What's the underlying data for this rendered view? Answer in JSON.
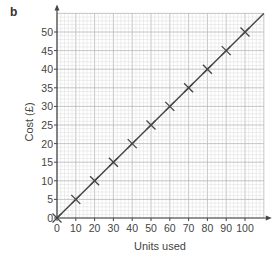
{
  "part_label": "b",
  "chart_data": {
    "type": "line",
    "title": "",
    "xlabel": "Units used",
    "ylabel": "Cost (£)",
    "xlim": [
      0,
      110
    ],
    "ylim": [
      0,
      55
    ],
    "x_ticks": [
      0,
      10,
      20,
      30,
      40,
      50,
      60,
      70,
      80,
      90,
      100
    ],
    "y_ticks": [
      0,
      5,
      10,
      15,
      20,
      25,
      30,
      35,
      40,
      45,
      50
    ],
    "grid": true,
    "legend": null,
    "series": [
      {
        "name": "Cost",
        "style": "line-with-cross-markers",
        "color": "#444444",
        "x": [
          0,
          10,
          20,
          30,
          40,
          50,
          60,
          70,
          80,
          90,
          100
        ],
        "y": [
          0,
          5,
          10,
          15,
          20,
          25,
          30,
          35,
          40,
          45,
          50
        ]
      }
    ],
    "line_extends_to": {
      "x": 110,
      "y": 55
    }
  },
  "colors": {
    "grid_minor": "#dddddd",
    "grid_major": "#b8b8b8",
    "axis": "#444444",
    "line": "#444444"
  }
}
